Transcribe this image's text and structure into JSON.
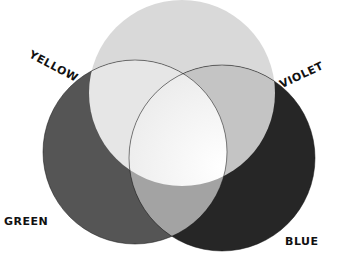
{
  "diagram": {
    "type": "venn-color-mixing",
    "circles": [
      {
        "name": "top",
        "cx": 182,
        "cy": 93,
        "r": 93,
        "color": "#d9d9d9"
      },
      {
        "name": "green",
        "cx": 135,
        "cy": 152,
        "r": 92,
        "color": "#555555"
      },
      {
        "name": "blue",
        "cx": 222,
        "cy": 158,
        "r": 93,
        "color": "#262626"
      }
    ],
    "regions": {
      "top_left_overlap": "#e6e6e6",
      "top_right_overlap": "#c4c4c4",
      "bottom_overlap": "#a3a3a3",
      "center": "#f6f6f6"
    }
  },
  "labels": {
    "yellow": "YELLOW",
    "violet": "VIOLET",
    "green": "GREEN",
    "blue": "BLUE"
  }
}
